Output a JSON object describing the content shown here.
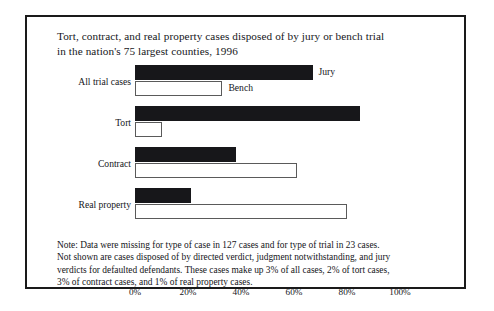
{
  "figure": {
    "title_line1": "Tort, contract, and real property cases disposed of by jury or bench trial",
    "title_line2": "in the nation's 75 largest counties, 1996",
    "note_line1": "Note:  Data were missing for type of case in 127 cases and for type of trial in 23 cases.",
    "note_line2": "Not shown are cases disposed of by directed verdict, judgment notwithstanding, and jury",
    "note_line3": "verdicts for defaulted defendants. These cases make up 3% of all cases, 2% of tort cases,",
    "note_line4": "3% of contract cases, and 1% of real property cases."
  },
  "labels": {
    "all_trial_cases": "All trial cases",
    "tort": "Tort",
    "contract": "Contract",
    "real_property": "Real property",
    "jury_tag": "Jury",
    "bench_tag": "Bench"
  },
  "axis": {
    "tick_0": "0%",
    "tick_20": "20%",
    "tick_40": "40%",
    "tick_60": "60%",
    "tick_80": "80%",
    "tick_100": "100%"
  },
  "colors": {
    "jury_fill": "#17171a",
    "bench_fill": "#ffffff",
    "bench_stroke": "#5a5a5a",
    "frame": "#1a1a1a",
    "text": "#15161a"
  },
  "chart_data": {
    "type": "bar",
    "orientation": "horizontal",
    "title": "Tort, contract, and real property cases disposed of by jury or bench trial in the nation's 75 largest counties, 1996",
    "xlabel": "",
    "ylabel": "",
    "xlim": [
      0,
      100
    ],
    "xticks": [
      0,
      20,
      40,
      60,
      80,
      100
    ],
    "xtick_labels": [
      "0%",
      "20%",
      "40%",
      "60%",
      "80%",
      "100%"
    ],
    "grid": false,
    "legend": "inline-labels",
    "categories": [
      "All trial cases",
      "Tort",
      "Contract",
      "Real property"
    ],
    "series": [
      {
        "name": "Jury",
        "values": [
          67,
          85,
          38,
          21
        ]
      },
      {
        "name": "Bench",
        "values": [
          33,
          10,
          61,
          80
        ]
      }
    ],
    "annotations": [
      "Note:  Data were missing for type of case in 127 cases and for type of trial in 23 cases.",
      "Not shown are cases disposed of by directed verdict, judgment notwithstanding, and jury verdicts for defaulted defendants. These cases make up 3% of all cases, 2% of tort cases, 3% of contract cases, and 1% of real property cases."
    ]
  }
}
